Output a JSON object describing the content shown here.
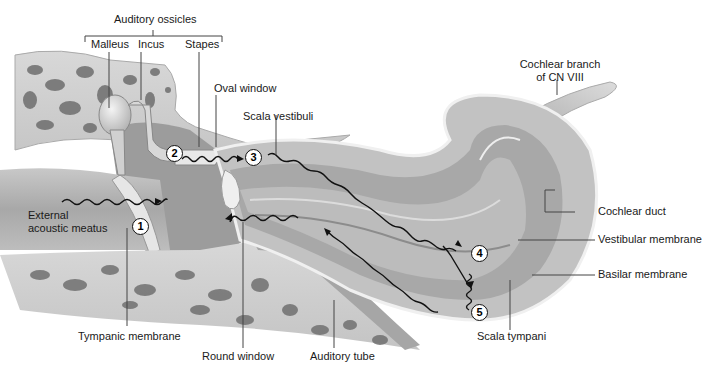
{
  "diagram": {
    "group_label": "Auditory ossicles",
    "labels": {
      "malleus": "Malleus",
      "incus": "Incus",
      "stapes": "Stapes",
      "oval_window": "Oval window",
      "scala_vestibuli": "Scala vestibuli",
      "cochlear_branch_line1": "Cochlear branch",
      "cochlear_branch_line2": "of CN VIII",
      "cochlear_duct": "Cochlear duct",
      "vestibular_membrane": "Vestibular membrane",
      "basilar_membrane": "Basilar membrane",
      "scala_tympani": "Scala tympani",
      "external_line1": "External",
      "external_line2": "acoustic meatus",
      "tympanic_membrane": "Tympanic membrane",
      "round_window": "Round window",
      "auditory_tube": "Auditory tube"
    },
    "steps": [
      "1",
      "2",
      "3",
      "4",
      "5"
    ],
    "colors": {
      "bone_light": "#e4e4e4",
      "bone_dark": "#8a8a8a",
      "canal": "#b8b8b8",
      "canal_dark": "#9a9a9a",
      "wave": "#111111",
      "line": "#444444",
      "text": "#1a1a1a"
    }
  }
}
